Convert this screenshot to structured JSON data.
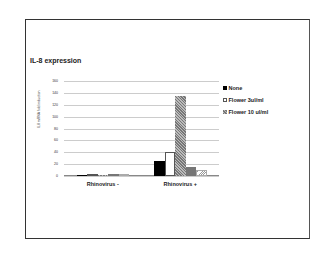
{
  "chart_data": {
    "type": "bar",
    "title": "IL-8 expression",
    "xlabel": "",
    "ylabel": "IL8 mRNA fold induction",
    "ylim": [
      0,
      160
    ],
    "yticks": [
      0,
      20,
      40,
      60,
      80,
      100,
      120,
      140,
      160
    ],
    "grid": true,
    "legend_position": "right",
    "categories": [
      "Rhinovirus -",
      "Rhinovirus +"
    ],
    "series": [
      {
        "name": "None",
        "values": [
          1,
          26
        ],
        "pattern": "solid-black"
      },
      {
        "name": "Flower 3ul/ml",
        "values": [
          1,
          40
        ],
        "pattern": "white"
      },
      {
        "name": "Flower 10 ul/ml",
        "values": [
          2,
          135
        ],
        "pattern": "gray-crosshatch"
      },
      {
        "name": "(unlabeled series 4)",
        "values": [
          3,
          16
        ],
        "pattern": "black-dotted"
      },
      {
        "name": "(unlabeled series 5)",
        "values": [
          1,
          10
        ],
        "pattern": "light-diagonal"
      }
    ]
  },
  "legend": [
    {
      "label": "None"
    },
    {
      "label": "Flower 3ul/ml"
    },
    {
      "label": "Flower 10 ul/ml"
    }
  ]
}
